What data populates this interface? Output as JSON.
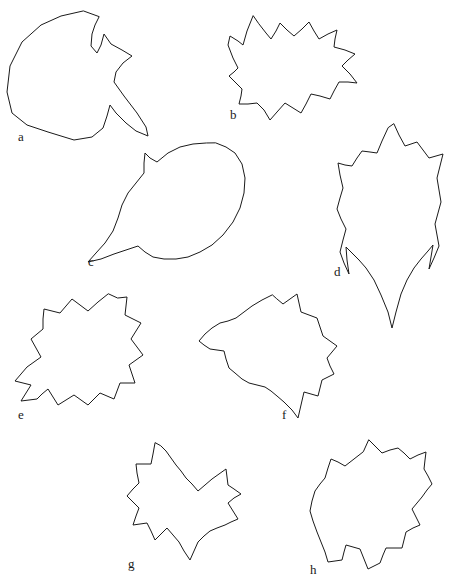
{
  "figure": {
    "caption": "",
    "background_color": "#ffffff",
    "stroke_color": "#1a1a1a",
    "label_color": "#1a1a1a",
    "shapes": [
      {
        "id": "a",
        "label": "a",
        "label_x": 18,
        "label_y": 130,
        "points": "83,11 61,16 41,25 22,42 10,66 7,92 12,113 27,125 48,132 74,140 92,137 103,128 107,116 110,105 116,113 126,123 136,131 148,136 146,127 137,113 124,96 114,82 116,72 123,63 132,56 122,50 111,44 104,34 101,45 97,53 91,46 92,34 95,25 99,17"
      },
      {
        "id": "b",
        "label": "b",
        "label_x": 230,
        "label_y": 108,
        "points": "253,16 247,31 243,45 238,41 230,36 228,45 233,58 238,68 234,72 229,76 236,83 242,89 241,96 239,104 248,104 257,103 264,110 270,120 277,112 285,103 293,108 301,113 306,104 311,94 320,96 330,99 334,91 339,82 348,82 357,83 350,74 342,66 348,60 355,54 345,50 334,47 335,39 337,30 328,34 319,39 314,31 309,22 302,29 294,36 287,30 280,23 276,31 271,39 266,33 259,24"
      },
      {
        "id": "c",
        "label": "c",
        "label_x": 88,
        "label_y": 255,
        "points": "206,143 193,144 180,147 168,153 157,162 150,158 145,153 144,163 144,173 136,183 128,193 122,205 118,218 113,231 105,243 96,253 88,262 101,259 114,254 126,250 138,246 145,252 153,257 164,259 176,259 188,257 200,252 212,245 223,235 233,222 240,208 244,193 245,178 242,164 235,153 226,147 216,143"
      },
      {
        "id": "d",
        "label": "d",
        "label_x": 334,
        "label_y": 265,
        "points": "388,128 382,141 377,153 370,152 362,151 357,158 352,166 345,165 338,163 340,175 343,188 340,198 337,209 341,219 346,229 343,240 340,252 344,263 349,274 347,260 346,247 352,253 359,260 366,268 374,280 381,295 388,312 392,328 396,312 401,294 407,280 414,268 421,259 428,251 433,245 431,257 429,269 434,258 439,246 437,235 435,224 438,213 441,202 439,190 437,178 440,166 443,154 436,156 429,158 423,150 417,142 411,144 405,146 399,135 394,124"
      },
      {
        "id": "e",
        "label": "e",
        "label_x": 18,
        "label_y": 408,
        "points": "108,294 98,302 88,311 80,305 72,299 66,306 60,313 52,311 44,309 43,319 43,329 37,334 31,339 36,348 41,357 34,362 27,367 21,374 15,381 23,383 31,385 26,393 21,401 29,400 37,399 42,394 48,389 53,397 58,405 66,400 74,395 81,400 88,405 94,399 100,393 107,396 114,399 117,391 120,383 127,383 135,383 132,374 129,365 136,360 143,355 137,347 131,339 136,331 141,323 133,319 125,315 126,306 127,297 118,298"
      },
      {
        "id": "f",
        "label": "f",
        "label_x": 282,
        "label_y": 408,
        "points": "272,295 262,300 252,306 244,312 236,318 228,321 220,323 212,328 205,334 199,341 204,345 210,349 217,350 224,351 226,359 229,368 235,373 242,379 249,383 257,385 265,387 271,391 277,396 284,402 292,410 298,418 301,405 304,392 311,394 318,396 320,388 322,380 328,377 334,374 330,366 327,358 332,352 337,346 330,341 323,336 320,327 317,318 309,315 301,312 299,303 297,294 290,299 283,304 277,299"
      },
      {
        "id": "g",
        "label": "g",
        "label_x": 128,
        "label_y": 557,
        "points": "155,443 153,454 151,464 143,464 136,464 137,473 139,483 133,489 127,496 133,502 139,508 136,516 133,525 140,524 147,523 151,531 155,540 161,534 167,528 173,535 179,542 184,551 190,560 194,551 198,542 204,536 210,531 217,528 225,525 231,522 238,519 233,511 228,503 234,498 241,494 234,489 228,485 227,477 226,469 219,474 212,479 205,485 198,491 192,484 186,478 181,471 176,465 171,458 166,451 161,446"
      },
      {
        "id": "h",
        "label": "h",
        "label_x": 310,
        "label_y": 563,
        "points": "363,452 354,459 345,466 338,462 331,459 328,468 325,478 320,484 315,491 312,501 310,511 313,521 317,532 321,542 325,552 328,562 335,561 342,560 344,552 346,545 353,547 360,549 364,559 368,569 374,566 380,563 383,555 386,548 394,548 402,548 404,540 406,532 413,528 420,525 416,517 412,509 417,503 422,497 427,490 432,484 428,476 424,469 425,460 426,452 418,455 410,459 404,453 398,448 390,450 382,453 375,446 369,440"
      }
    ]
  }
}
